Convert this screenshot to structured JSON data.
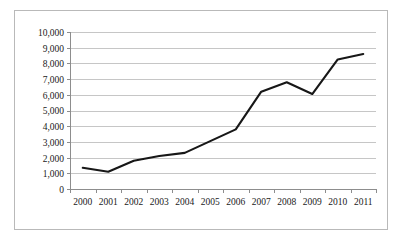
{
  "chart_data": {
    "type": "line",
    "title": "",
    "subtitle": "",
    "xlabel": "",
    "ylabel": "",
    "categories": [
      "2000",
      "2001",
      "2002",
      "2003",
      "2004",
      "2005",
      "2006",
      "2007",
      "2008",
      "2009",
      "2010",
      "2011"
    ],
    "series": [
      {
        "name": "",
        "values": [
          1350,
          1100,
          1800,
          2100,
          2300,
          3050,
          3800,
          6200,
          6800,
          6050,
          8250,
          8600
        ]
      }
    ],
    "ylim": [
      0,
      10000
    ],
    "ytick_step": 1000,
    "ytick_labels": [
      "0",
      "1,000",
      "2,000",
      "3,000",
      "4,000",
      "5,000",
      "6,000",
      "7,000",
      "8,000",
      "9,000",
      "10,000"
    ],
    "ytick_values": [
      0,
      1000,
      2000,
      3000,
      4000,
      5000,
      6000,
      7000,
      8000,
      9000,
      10000
    ],
    "xtick_labels": [
      "2000",
      "2001",
      "2002",
      "2003",
      "2004",
      "2005",
      "2006",
      "2007",
      "2008",
      "2009",
      "2010",
      "2011"
    ],
    "grid": {
      "horizontal": true,
      "vertical": false
    },
    "legend": {
      "visible": false,
      "position": "none",
      "entries": []
    },
    "colors": {
      "series_line": "#171717",
      "gridline": "#c6c6c6",
      "axis": "#8d8d8d",
      "frame_border": "#b9b9b9",
      "background": "#ffffff",
      "tick_label": "#1a1a1a"
    },
    "annotations": []
  }
}
